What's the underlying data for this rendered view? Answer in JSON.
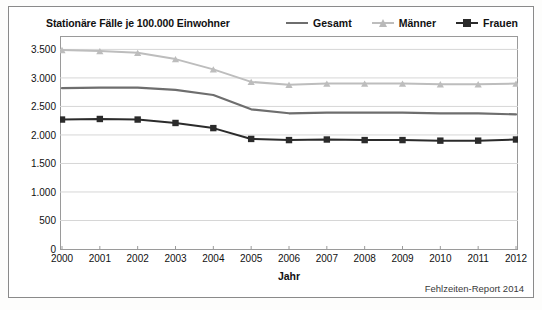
{
  "chart_data": {
    "type": "line",
    "title": "Stationäre Fälle je 100.000 Einwohner",
    "xlabel": "Jahr",
    "ylabel": "",
    "x": [
      2000,
      2001,
      2002,
      2003,
      2004,
      2005,
      2006,
      2007,
      2008,
      2009,
      2010,
      2011,
      2012
    ],
    "xtick_labels": [
      "2000",
      "2001",
      "2002",
      "2003",
      "2004",
      "2005",
      "2006",
      "2007",
      "2008",
      "2009",
      "2010",
      "2011",
      "2012"
    ],
    "ytick_labels": [
      "0",
      "500",
      "1.000",
      "1.500",
      "2.000",
      "2.500",
      "3.000",
      "3.500"
    ],
    "ytick_values": [
      0,
      500,
      1000,
      1500,
      2000,
      2500,
      3000,
      3500
    ],
    "ylim": [
      0,
      3700
    ],
    "xlim": [
      2000,
      2012
    ],
    "grid": true,
    "legend_position": "top-right",
    "series": [
      {
        "name": "Gesamt",
        "color": "#6e6e6e",
        "marker": "none",
        "values": [
          2820,
          2830,
          2830,
          2790,
          2700,
          2450,
          2380,
          2390,
          2390,
          2390,
          2380,
          2380,
          2360
        ]
      },
      {
        "name": "Männer",
        "color": "#bdbdbd",
        "marker": "triangle",
        "values": [
          3490,
          3470,
          3440,
          3330,
          3150,
          2930,
          2880,
          2900,
          2900,
          2900,
          2890,
          2890,
          2900
        ]
      },
      {
        "name": "Frauen",
        "color": "#2b2b2b",
        "marker": "square",
        "values": [
          2270,
          2280,
          2270,
          2210,
          2120,
          1930,
          1910,
          1920,
          1910,
          1910,
          1900,
          1900,
          1920
        ]
      }
    ]
  },
  "footer": {
    "source_note": "Fehlzeiten-Report 2014"
  }
}
